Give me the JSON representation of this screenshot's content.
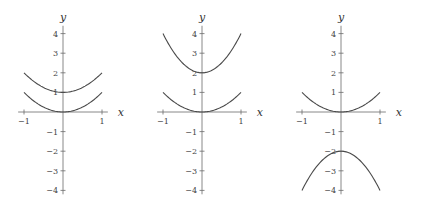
{
  "chart_data": [
    {
      "type": "line",
      "title": "",
      "xlabel": "x",
      "ylabel": "y",
      "xlim": [
        -1.15,
        1.15
      ],
      "ylim": [
        -4.2,
        4.4
      ],
      "xticks": [
        -1,
        1
      ],
      "yticks": [
        -4,
        -3,
        -2,
        -1,
        1,
        2,
        3,
        4
      ],
      "xtick_labels": [
        "−1",
        "1"
      ],
      "ytick_labels": [
        "−4",
        "−3",
        "−2",
        "−1",
        "1",
        "2",
        "3",
        "4"
      ],
      "series": [
        {
          "name": "y = x^2",
          "x": [
            -1,
            -0.5,
            0,
            0.5,
            1
          ],
          "y": [
            1,
            0.25,
            0,
            0.25,
            1
          ]
        },
        {
          "name": "y = x^2 + 1",
          "x": [
            -1,
            -0.5,
            0,
            0.5,
            1
          ],
          "y": [
            2,
            1.25,
            1,
            1.25,
            2
          ]
        }
      ],
      "grid": false,
      "legend": false
    },
    {
      "type": "line",
      "title": "",
      "xlabel": "x",
      "ylabel": "y",
      "xlim": [
        -1.15,
        1.15
      ],
      "ylim": [
        -4.2,
        4.4
      ],
      "xticks": [
        -1,
        1
      ],
      "yticks": [
        -4,
        -3,
        -2,
        -1,
        1,
        2,
        3,
        4
      ],
      "xtick_labels": [
        "−1",
        "1"
      ],
      "ytick_labels": [
        "−4",
        "−3",
        "−2",
        "−1",
        "1",
        "2",
        "3",
        "4"
      ],
      "series": [
        {
          "name": "y = x^2",
          "x": [
            -1,
            -0.5,
            0,
            0.5,
            1
          ],
          "y": [
            1,
            0.25,
            0,
            0.25,
            1
          ]
        },
        {
          "name": "y = 2x^2 + 2",
          "x": [
            -1,
            -0.5,
            0,
            0.5,
            1
          ],
          "y": [
            4,
            2.5,
            2,
            2.5,
            4
          ]
        }
      ],
      "grid": false,
      "legend": false
    },
    {
      "type": "line",
      "title": "",
      "xlabel": "x",
      "ylabel": "y",
      "xlim": [
        -1.15,
        1.15
      ],
      "ylim": [
        -4.2,
        4.4
      ],
      "xticks": [
        -1,
        1
      ],
      "yticks": [
        -4,
        -3,
        -2,
        -1,
        1,
        2,
        3,
        4
      ],
      "xtick_labels": [
        "−1",
        "1"
      ],
      "ytick_labels": [
        "−4",
        "−3",
        "−2",
        "−1",
        "1",
        "2",
        "3",
        "4"
      ],
      "series": [
        {
          "name": "y = x^2",
          "x": [
            -1,
            -0.5,
            0,
            0.5,
            1
          ],
          "y": [
            1,
            0.25,
            0,
            0.25,
            1
          ]
        },
        {
          "name": "y = -2x^2 - 2",
          "x": [
            -1,
            -0.5,
            0,
            0.5,
            1
          ],
          "y": [
            -4,
            -2.5,
            -2,
            -2.5,
            -4
          ]
        }
      ],
      "grid": false,
      "legend": false
    }
  ],
  "panels": [
    {
      "origin_x": 63,
      "origin_y": 112,
      "curves": [
        {
          "a": 1,
          "c": 0
        },
        {
          "a": 1,
          "c": 1
        }
      ]
    },
    {
      "origin_x": 202,
      "origin_y": 112,
      "curves": [
        {
          "a": 1,
          "c": 0
        },
        {
          "a": 2,
          "c": 2
        }
      ]
    },
    {
      "origin_x": 341,
      "origin_y": 112,
      "curves": [
        {
          "a": 1,
          "c": 0
        },
        {
          "a": -2,
          "c": -2
        }
      ]
    }
  ],
  "scale": {
    "x_unit_px": 39,
    "y_unit_px": 19.6
  },
  "style": {
    "curve_color": "#4a4a4a",
    "axis_color": "#6a6a6a"
  }
}
